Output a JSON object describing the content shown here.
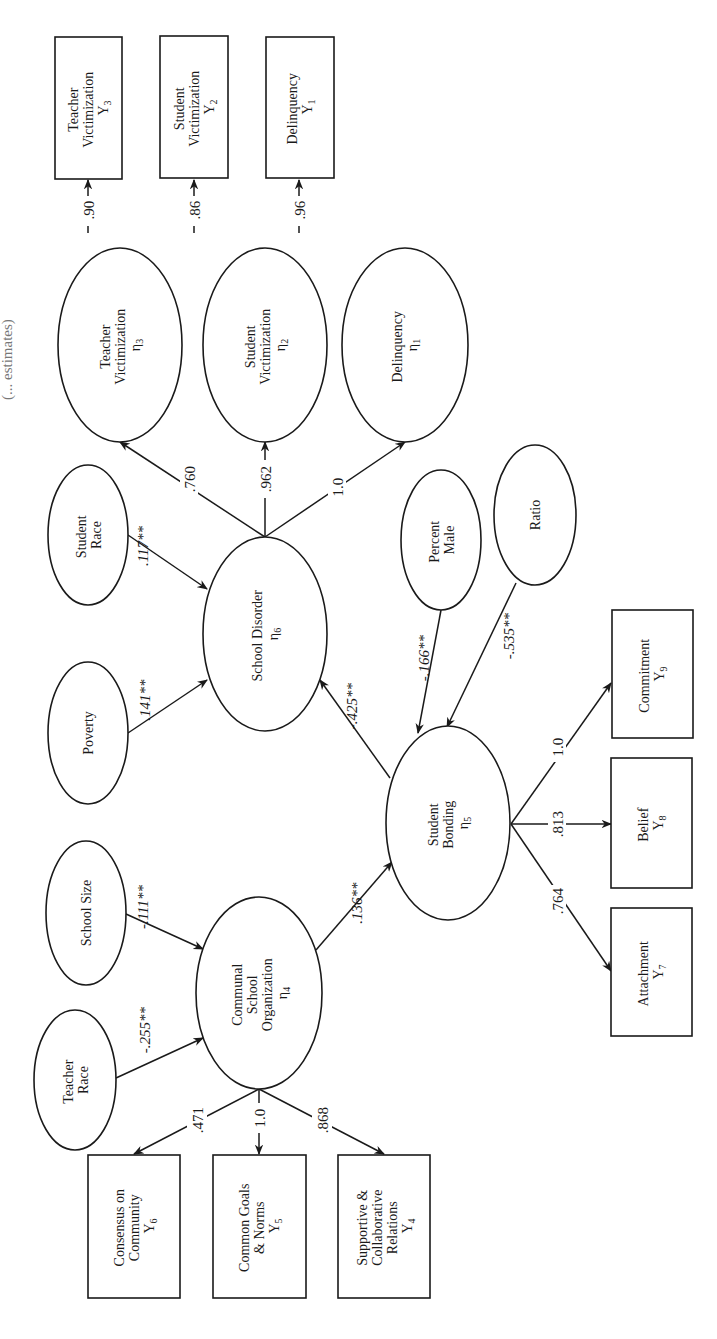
{
  "figure": {
    "orientation": "rotated 90 degrees counter-clockwise",
    "title_fragments": [
      "...ypothesized ...",
      "(... estimates)"
    ]
  },
  "latent": {
    "eta1": {
      "label": "Delinquency",
      "symbol": "η",
      "sub": "1"
    },
    "eta2": {
      "line1": "Student",
      "line2": "Victimization",
      "symbol": "η",
      "sub": "2"
    },
    "eta3": {
      "line1": "Teacher",
      "line2": "Victimization",
      "symbol": "η",
      "sub": "3"
    },
    "eta4": {
      "line1": "Communal",
      "line2": "School",
      "line3": "Organization",
      "symbol": "η",
      "sub": "4"
    },
    "eta5": {
      "line1": "Student",
      "line2": "Bonding",
      "symbol": "η",
      "sub": "5"
    },
    "eta6": {
      "label": "School Disorder",
      "symbol": "η",
      "sub": "6"
    }
  },
  "exogenous": {
    "poverty": "Poverty",
    "student_race": {
      "line1": "Student",
      "line2": "Race"
    },
    "school_size": "School Size",
    "teacher_race": {
      "line1": "Teacher",
      "line2": "Race"
    },
    "percent_male": {
      "line1": "Percent",
      "line2": "Male"
    },
    "ratio": "Ratio"
  },
  "indicators": {
    "y1": {
      "label": "Delinquency",
      "symbol": "Y",
      "sub": "1"
    },
    "y2": {
      "line1": "Student",
      "line2": "Victimization",
      "symbol": "Y",
      "sub": "2"
    },
    "y3": {
      "line1": "Teacher",
      "line2": "Victimization",
      "symbol": "Y",
      "sub": "3"
    },
    "y4": {
      "line1": "Supportive &",
      "line2": "Collaborative",
      "line3": "Relations",
      "symbol": "Y",
      "sub": "4"
    },
    "y5": {
      "line1": "Common Goals",
      "line2": "& Norms",
      "symbol": "Y",
      "sub": "5"
    },
    "y6": {
      "line1": "Consensus on",
      "line2": "Community",
      "symbol": "Y",
      "sub": "6"
    },
    "y7": {
      "label": "Attachment",
      "symbol": "Y",
      "sub": "7"
    },
    "y8": {
      "label": "Belief",
      "symbol": "Y",
      "sub": "8"
    },
    "y9": {
      "label": "Commitment",
      "symbol": "Y",
      "sub": "9"
    }
  },
  "coefficients": {
    "eta3_y3": ".90",
    "eta2_y2": ".86",
    "eta1_y1": ".96",
    "eta6_eta3": ".760",
    "eta6_eta2": ".962",
    "eta6_eta1": "1.0",
    "race_eta6": ".117**",
    "poverty_eta6": ".141**",
    "eta5_eta6": "-.425**",
    "male_eta5": "-.166**",
    "ratio_eta5": "-.535**",
    "eta5_y9": "1.0",
    "eta5_y8": ".813",
    "eta5_y7": ".764",
    "size_eta4": "-.111**",
    "trace_eta4": "-.255**",
    "eta4_eta5": ".136**",
    "eta4_y6": ".471",
    "eta4_y5": "1.0",
    "eta4_y4": ".868"
  },
  "colors": {
    "ink": "#1a1a1a",
    "background": "#ffffff"
  }
}
